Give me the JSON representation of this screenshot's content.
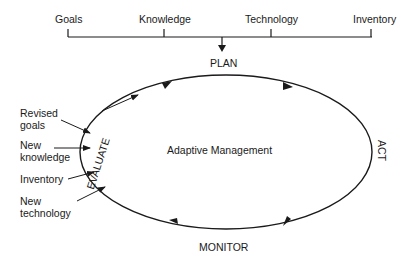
{
  "inputs_bar": {
    "items": [
      "Goals",
      "Knowledge",
      "Technology",
      "Inventory"
    ]
  },
  "cycle": {
    "center_label": "Adaptive Management",
    "stages": {
      "top": "PLAN",
      "right": "ACT",
      "bottom": "MONITOR",
      "left": "EVALUATE"
    }
  },
  "feedback_inputs": {
    "revised_goals": [
      "Revised",
      "goals"
    ],
    "new_knowledge": [
      "New",
      "knowledge"
    ],
    "inventory": [
      "Inventory"
    ],
    "new_technology": [
      "New",
      "technology"
    ]
  },
  "colors": {
    "ink": "#1a1a1a",
    "background": "#ffffff"
  }
}
